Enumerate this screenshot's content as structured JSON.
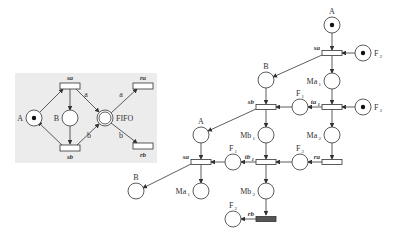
{
  "inset": {
    "background": "#ececec",
    "places": [
      {
        "id": "A",
        "label": "A",
        "x": 34,
        "y": 118,
        "token": true,
        "double": false,
        "label_pos": "left"
      },
      {
        "id": "B",
        "label": "B",
        "x": 70,
        "y": 118,
        "token": false,
        "double": false,
        "label_pos": "left"
      },
      {
        "id": "FIFO",
        "label": "FIFO",
        "x": 105,
        "y": 118,
        "token": false,
        "double": true,
        "label_pos": "right"
      }
    ],
    "transitions": [
      {
        "id": "sa",
        "label": "sa",
        "x": 70,
        "y": 86,
        "label_pos": "top",
        "filled": false
      },
      {
        "id": "sb",
        "label": "sb",
        "x": 70,
        "y": 148,
        "label_pos": "bottom",
        "filled": false
      },
      {
        "id": "ra",
        "label": "ra",
        "x": 143,
        "y": 86,
        "label_pos": "top",
        "filled": false
      },
      {
        "id": "rb",
        "label": "rb",
        "x": 143,
        "y": 146,
        "label_pos": "bottom",
        "filled": false
      }
    ],
    "arc_labels": [
      {
        "text": "a",
        "x": 86,
        "y": 97
      },
      {
        "text": "b",
        "x": 89,
        "y": 138
      },
      {
        "text": "a",
        "x": 121,
        "y": 97
      },
      {
        "text": "b",
        "x": 121,
        "y": 138
      }
    ]
  },
  "main": {
    "places": [
      {
        "id": "A1",
        "label": "A",
        "sub": "",
        "x": 332,
        "y": 25,
        "token": true,
        "label_pos": "top"
      },
      {
        "id": "F2a",
        "label": "F",
        "sub": "2",
        "x": 363,
        "y": 53,
        "token": true,
        "label_pos": "right"
      },
      {
        "id": "B1",
        "label": "B",
        "sub": "",
        "x": 266,
        "y": 80,
        "token": false,
        "label_pos": "top"
      },
      {
        "id": "Ma1a",
        "label": "Ma",
        "sub": "1",
        "x": 332,
        "y": 81,
        "token": false,
        "label_pos": "left"
      },
      {
        "id": "F1a",
        "label": "F",
        "sub": "1",
        "x": 300,
        "y": 107,
        "token": false,
        "label_pos": "top"
      },
      {
        "id": "F2b",
        "label": "F",
        "sub": "2",
        "x": 363,
        "y": 107,
        "token": true,
        "label_pos": "right"
      },
      {
        "id": "Mb1",
        "label": "Mb",
        "sub": "1",
        "x": 266,
        "y": 135,
        "token": false,
        "label_pos": "left"
      },
      {
        "id": "Ma2",
        "label": "Ma",
        "sub": "2",
        "x": 332,
        "y": 135,
        "token": false,
        "label_pos": "left"
      },
      {
        "id": "A2",
        "label": "A",
        "sub": "",
        "x": 201,
        "y": 135,
        "token": false,
        "label_pos": "top"
      },
      {
        "id": "F1b",
        "label": "F",
        "sub": "1",
        "x": 233,
        "y": 162,
        "token": false,
        "label_pos": "top"
      },
      {
        "id": "F2c",
        "label": "F",
        "sub": "2",
        "x": 300,
        "y": 162,
        "token": false,
        "label_pos": "top"
      },
      {
        "id": "B2",
        "label": "B",
        "sub": "",
        "x": 136,
        "y": 191,
        "token": false,
        "label_pos": "top"
      },
      {
        "id": "Ma1b",
        "label": "Ma",
        "sub": "1",
        "x": 201,
        "y": 191,
        "token": false,
        "label_pos": "left"
      },
      {
        "id": "Mb2",
        "label": "Mb",
        "sub": "2",
        "x": 266,
        "y": 191,
        "token": false,
        "label_pos": "left"
      },
      {
        "id": "F2d",
        "label": "F",
        "sub": "2",
        "x": 233,
        "y": 219,
        "token": false,
        "label_pos": "top"
      }
    ],
    "transitions": [
      {
        "id": "sa1",
        "label": "sa",
        "sub": "",
        "x": 332,
        "y": 53,
        "filled": false
      },
      {
        "id": "sb",
        "label": "sb",
        "sub": "",
        "x": 266,
        "y": 107,
        "filled": false
      },
      {
        "id": "ta1",
        "label": "ta",
        "sub": "1",
        "x": 332,
        "y": 107,
        "filled": false
      },
      {
        "id": "tb1",
        "label": "tb",
        "sub": "1",
        "x": 266,
        "y": 162,
        "filled": false
      },
      {
        "id": "ra",
        "label": "ra",
        "sub": "",
        "x": 332,
        "y": 162,
        "filled": false
      },
      {
        "id": "sa2",
        "label": "sa",
        "sub": "",
        "x": 201,
        "y": 162,
        "filled": false
      },
      {
        "id": "rb",
        "label": "rb",
        "sub": "",
        "x": 266,
        "y": 219,
        "filled": true
      }
    ]
  }
}
